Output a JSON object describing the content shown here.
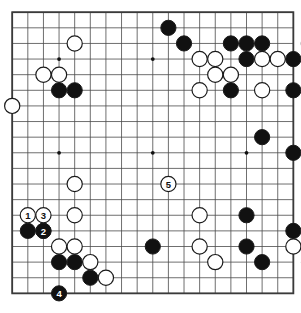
{
  "board": {
    "name": "go-board",
    "size": 19,
    "origin_x": 12.2,
    "origin_y": 12.2,
    "spacing": 15.62,
    "stone_radius": 7.6,
    "colors": {
      "background": "#ffffff",
      "grid_line": "#4a4a4a",
      "border_line": "#3a3a3a",
      "black_stone": "#111111",
      "white_stone": "#ffffff",
      "stone_outline": "#1a1a1a",
      "star_point": "#111111",
      "black_label_text": "#ffffff",
      "white_label_text": "#111111"
    },
    "star_points": [
      {
        "col": 3,
        "row": 3
      },
      {
        "col": 9,
        "row": 3
      },
      {
        "col": 15,
        "row": 3
      },
      {
        "col": 3,
        "row": 9
      },
      {
        "col": 9,
        "row": 9
      },
      {
        "col": 15,
        "row": 9
      },
      {
        "col": 3,
        "row": 15
      },
      {
        "col": 9,
        "row": 15
      },
      {
        "col": 15,
        "row": 15
      }
    ]
  },
  "stones": {
    "black": [
      {
        "col": 10,
        "row": 1
      },
      {
        "col": 11,
        "row": 2
      },
      {
        "col": 14,
        "row": 2
      },
      {
        "col": 15,
        "row": 2
      },
      {
        "col": 16,
        "row": 2
      },
      {
        "col": 15,
        "row": 3
      },
      {
        "col": 18,
        "row": 3
      },
      {
        "col": 3,
        "row": 5
      },
      {
        "col": 4,
        "row": 5
      },
      {
        "col": 14,
        "row": 5
      },
      {
        "col": 18,
        "row": 5
      },
      {
        "col": 16,
        "row": 8
      },
      {
        "col": 18,
        "row": 9
      },
      {
        "col": 15,
        "row": 13
      },
      {
        "col": 1,
        "row": 14
      },
      {
        "col": 2,
        "row": 14
      },
      {
        "col": 15,
        "row": 15
      },
      {
        "col": 9,
        "row": 15
      },
      {
        "col": 18,
        "row": 14
      },
      {
        "col": 19,
        "row": 15
      },
      {
        "col": 19,
        "row": 16
      },
      {
        "col": 3,
        "row": 16
      },
      {
        "col": 4,
        "row": 16
      },
      {
        "col": 16,
        "row": 16
      },
      {
        "col": 5,
        "row": 17
      }
    ],
    "white": [
      {
        "col": 4,
        "row": 2
      },
      {
        "col": 19,
        "row": 2
      },
      {
        "col": 12,
        "row": 3
      },
      {
        "col": 13,
        "row": 3
      },
      {
        "col": 16,
        "row": 3
      },
      {
        "col": 17,
        "row": 3
      },
      {
        "col": 2,
        "row": 4
      },
      {
        "col": 3,
        "row": 4
      },
      {
        "col": 13,
        "row": 4
      },
      {
        "col": 14,
        "row": 4
      },
      {
        "col": 12,
        "row": 5
      },
      {
        "col": 16,
        "row": 5
      },
      {
        "col": 0,
        "row": 6
      },
      {
        "col": 4,
        "row": 11
      },
      {
        "col": 4,
        "row": 13
      },
      {
        "col": 12,
        "row": 13
      },
      {
        "col": 3,
        "row": 15
      },
      {
        "col": 4,
        "row": 15
      },
      {
        "col": 12,
        "row": 15
      },
      {
        "col": 18,
        "row": 15
      },
      {
        "col": 5,
        "row": 16
      },
      {
        "col": 13,
        "row": 16
      },
      {
        "col": 6,
        "row": 17
      }
    ]
  },
  "numbered_moves": [
    {
      "label": "1",
      "color": "white",
      "col": 1,
      "row": 13
    },
    {
      "label": "2",
      "color": "black",
      "col": 2,
      "row": 14
    },
    {
      "label": "3",
      "color": "white",
      "col": 2,
      "row": 13
    },
    {
      "label": "4",
      "color": "black",
      "col": 3,
      "row": 18
    },
    {
      "label": "5",
      "color": "white",
      "col": 10,
      "row": 11
    }
  ]
}
